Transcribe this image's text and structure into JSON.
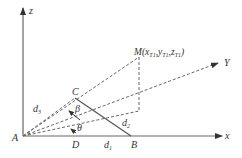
{
  "diagram": {
    "axes": {
      "z_label": "z",
      "x_label": "x",
      "y_label": "Y"
    },
    "points": {
      "origin": "A",
      "C": "C",
      "D": "D",
      "B": "B",
      "M_label": "M",
      "M_coords": "(x",
      "M_sub1": "T1",
      "M_mid1": ",y",
      "M_sub2": "T1",
      "M_mid2": ",z",
      "M_sub3": "T1",
      "M_close": ")"
    },
    "distances": {
      "d1": "d",
      "d1_sub": "1",
      "d2": "d",
      "d2_sub": "2",
      "d3": "d",
      "d3_sub": "3"
    },
    "angles": {
      "beta": "β",
      "theta": "θ"
    },
    "colors": {
      "line": "#555555",
      "text": "#333333",
      "background": "#ffffff"
    }
  }
}
